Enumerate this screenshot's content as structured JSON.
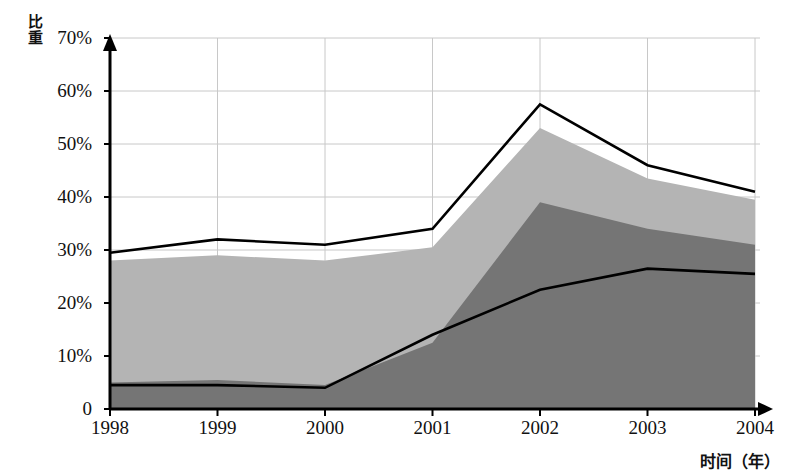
{
  "chart_data": {
    "type": "area",
    "title": "",
    "subtitle": "",
    "xlabel": "时间（年）",
    "ylabel": "比重",
    "categories": [
      "1998",
      "1999",
      "2000",
      "2001",
      "2002",
      "2003",
      "2004"
    ],
    "x": [
      1998,
      1999,
      2000,
      2001,
      2002,
      2003,
      2004
    ],
    "ylim": [
      0,
      70
    ],
    "yticks": [
      0,
      10,
      20,
      30,
      40,
      50,
      60,
      70
    ],
    "ytick_labels": [
      "0",
      "10%",
      "20%",
      "30%",
      "40%",
      "50%",
      "60%",
      "70%"
    ],
    "grid": true,
    "grid_axis": "both",
    "legend": "none",
    "series": [
      {
        "name": "total-top-line",
        "kind": "line",
        "color": "#000000",
        "values": [
          29.5,
          32.0,
          31.0,
          34.0,
          57.5,
          46.0,
          41.0
        ]
      },
      {
        "name": "light-gray-area-top",
        "kind": "area",
        "color": "#b4b4b4",
        "values": [
          28.0,
          29.0,
          28.0,
          30.5,
          53.0,
          43.5,
          39.5
        ]
      },
      {
        "name": "dark-gray-area-top",
        "kind": "area",
        "color": "#757575",
        "values": [
          5.0,
          5.5,
          4.5,
          12.5,
          39.0,
          34.0,
          31.0
        ]
      },
      {
        "name": "inner-black-line",
        "kind": "line",
        "color": "#000000",
        "values": [
          4.5,
          4.5,
          4.0,
          14.0,
          22.5,
          26.5,
          25.5
        ]
      }
    ],
    "colors": {
      "axis": "#000000",
      "grid": "#c8c8c8",
      "light_area": "#b4b4b4",
      "dark_area": "#757575",
      "line": "#000000",
      "background": "#ffffff"
    }
  },
  "axes": {
    "y_label": "比重",
    "y_label_chars": [
      "比",
      "重"
    ],
    "x_label": "时间（年）",
    "y_ticks": [
      {
        "label": "70%",
        "value": 70
      },
      {
        "label": "60%",
        "value": 60
      },
      {
        "label": "50%",
        "value": 50
      },
      {
        "label": "40%",
        "value": 40
      },
      {
        "label": "30%",
        "value": 30
      },
      {
        "label": "20%",
        "value": 20
      },
      {
        "label": "10%",
        "value": 10
      },
      {
        "label": "0",
        "value": 0
      }
    ],
    "x_ticks": [
      {
        "label": "1998"
      },
      {
        "label": "1999"
      },
      {
        "label": "2000"
      },
      {
        "label": "2001"
      },
      {
        "label": "2002"
      },
      {
        "label": "2003"
      },
      {
        "label": "2004"
      }
    ]
  }
}
